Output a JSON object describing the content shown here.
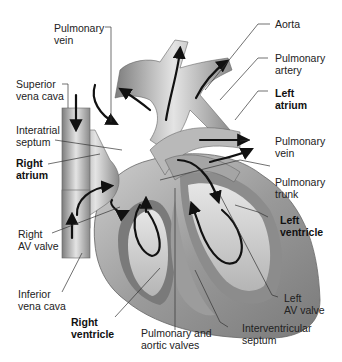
{
  "diagram": {
    "labels": {
      "pulmonary_vein_top": {
        "line1": "Pulmonary",
        "line2": "vein",
        "bold": false
      },
      "superior_vena_cava": {
        "line1": "Superior",
        "line2": "vena cava",
        "bold": false
      },
      "interatrial_septum": {
        "line1": "Interatrial",
        "line2": "septum",
        "bold": false
      },
      "right_atrium": {
        "line1": "Right",
        "line2": "atrium",
        "bold": true
      },
      "right_av_valve": {
        "line1": "Right",
        "line2": "AV valve",
        "bold": false
      },
      "inferior_vena_cava": {
        "line1": "Inferior",
        "line2": "vena cava",
        "bold": false
      },
      "right_ventricle": {
        "line1": "Right",
        "line2": "ventricle",
        "bold": true
      },
      "pulmonary_aortic_valves": {
        "line1": "Pulmonary and",
        "line2": "aortic valves",
        "bold": false
      },
      "interventricular_septum": {
        "line1": "Interventricular",
        "line2": "septum",
        "bold": false
      },
      "left_av_valve": {
        "line1": "Left",
        "line2": "AV valve",
        "bold": false
      },
      "left_ventricle": {
        "line1": "Left",
        "line2": "ventricle",
        "bold": true
      },
      "pulmonary_trunk": {
        "line1": "Pulmonary",
        "line2": "trunk",
        "bold": false
      },
      "pulmonary_vein_right": {
        "line1": "Pulmonary",
        "line2": "vein",
        "bold": false
      },
      "left_atrium": {
        "line1": "Left",
        "line2": "atrium",
        "bold": true
      },
      "pulmonary_artery": {
        "line1": "Pulmonary",
        "line2": "artery",
        "bold": false
      },
      "aorta": {
        "line1": "Aorta",
        "line2": "",
        "bold": false
      }
    },
    "colors": {
      "tissue_light": "#d9d9d9",
      "tissue_mid": "#a8a8a8",
      "tissue_dark": "#6e6e6e",
      "arrow": "#111111",
      "leader_line": "#333333"
    }
  }
}
